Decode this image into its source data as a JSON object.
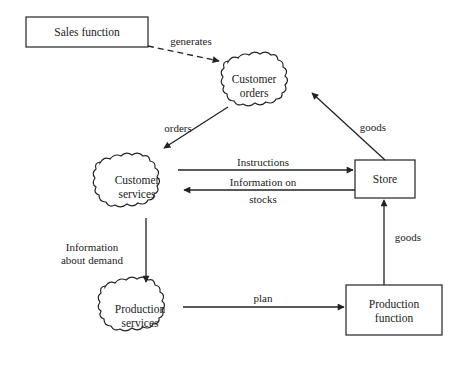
{
  "diagram": {
    "nodes": [
      {
        "id": "sales",
        "shape": "rectangle",
        "lines": [
          "Sales function"
        ]
      },
      {
        "id": "orders",
        "shape": "cloud",
        "lines": [
          "Customer",
          "orders"
        ]
      },
      {
        "id": "cservices",
        "shape": "cloud",
        "lines": [
          "Customer",
          "services"
        ]
      },
      {
        "id": "store",
        "shape": "rectangle",
        "lines": [
          "Store"
        ]
      },
      {
        "id": "pservices",
        "shape": "cloud",
        "lines": [
          "Production",
          "services"
        ]
      },
      {
        "id": "pfunction",
        "shape": "rectangle",
        "lines": [
          "Production",
          "function"
        ]
      }
    ],
    "edges": [
      {
        "from": "sales",
        "to": "orders",
        "style": "dashed",
        "lines": [
          "generates"
        ]
      },
      {
        "from": "orders",
        "to": "cservices",
        "style": "solid",
        "lines": [
          "orders"
        ]
      },
      {
        "from": "store",
        "to": "orders",
        "style": "solid",
        "lines": [
          "goods"
        ]
      },
      {
        "from": "cservices",
        "to": "store",
        "style": "solid",
        "lines": [
          "Instructions"
        ]
      },
      {
        "from": "store",
        "to": "cservices",
        "style": "solid",
        "lines": [
          "Information on",
          "stocks"
        ]
      },
      {
        "from": "cservices",
        "to": "pservices",
        "style": "solid",
        "lines": [
          "Information",
          "about demand"
        ]
      },
      {
        "from": "pservices",
        "to": "pfunction",
        "style": "solid",
        "lines": [
          "plan"
        ]
      },
      {
        "from": "pfunction",
        "to": "store",
        "style": "solid",
        "lines": [
          "goods"
        ]
      }
    ]
  }
}
